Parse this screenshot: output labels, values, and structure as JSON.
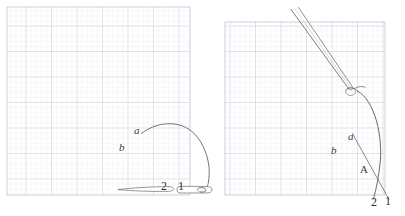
{
  "figure": {
    "title": "",
    "background_color": "#ffffff",
    "width": 405,
    "height": 216,
    "grid_minor_color": "#dfe3ec",
    "grid_major_color": "#c3c9d8",
    "ink_color": "#4a4a4a",
    "label_color": "#3d3d3d"
  },
  "panels": [
    {
      "id": "left-panel",
      "name": "panel-left",
      "grid": {
        "x": 7,
        "y": 7,
        "width": 183,
        "height": 188,
        "cell": 5.1,
        "major_every": 5
      },
      "labels": [
        {
          "text": "a",
          "style": "italic",
          "x": 134,
          "y": 134
        },
        {
          "text": "b",
          "style": "italic",
          "x": 119,
          "y": 151
        },
        {
          "text": "2",
          "style": "upright",
          "x": 161,
          "y": 190
        },
        {
          "text": "1",
          "style": "upright",
          "x": 178,
          "y": 190
        }
      ],
      "elements": [
        "curved-needle-arch",
        "tissue-line-left",
        "tissue-line-right",
        "thread-loop"
      ]
    },
    {
      "id": "right-panel",
      "name": "panel-right",
      "grid": {
        "x": 225,
        "y": 22,
        "width": 160,
        "height": 173,
        "cell": 5.1,
        "major_every": 5
      },
      "labels": [
        {
          "text": "a",
          "style": "italic",
          "x": 348,
          "y": 140
        },
        {
          "text": "b",
          "style": "italic",
          "x": 331,
          "y": 154
        },
        {
          "text": "A",
          "style": "upright",
          "x": 360,
          "y": 173
        },
        {
          "text": "2",
          "style": "upright",
          "x": 371,
          "y": 206
        },
        {
          "text": "1",
          "style": "upright",
          "x": 385,
          "y": 205
        }
      ],
      "elements": [
        "needle-holder-shaft",
        "needle-tip-hook",
        "curved-needle-arc",
        "suture-line-a-b"
      ]
    }
  ],
  "annotations": {
    "caption": ""
  }
}
